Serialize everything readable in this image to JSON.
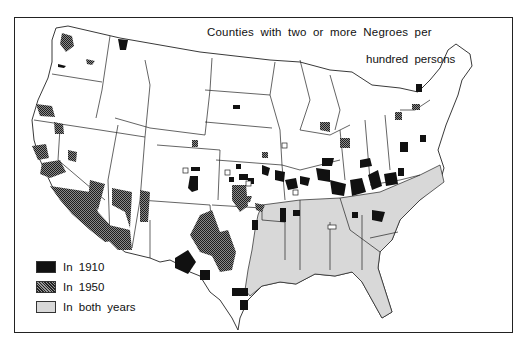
{
  "map": {
    "title_line1": "Counties with two or more Negroes per",
    "title_line2": "hundred persons",
    "region": "Continental United States",
    "colors": {
      "in_1910": "#111111",
      "in_1950": "#555555",
      "in_both_years": "#d8d8d8",
      "state_fill": "#ffffff",
      "state_border": "#222222"
    }
  },
  "legend": {
    "items": [
      {
        "label": "In 1910",
        "pattern": "solid-black"
      },
      {
        "label": "In 1950",
        "pattern": "crosshatch-dark"
      },
      {
        "label": "In both years",
        "pattern": "light-gray"
      }
    ]
  }
}
